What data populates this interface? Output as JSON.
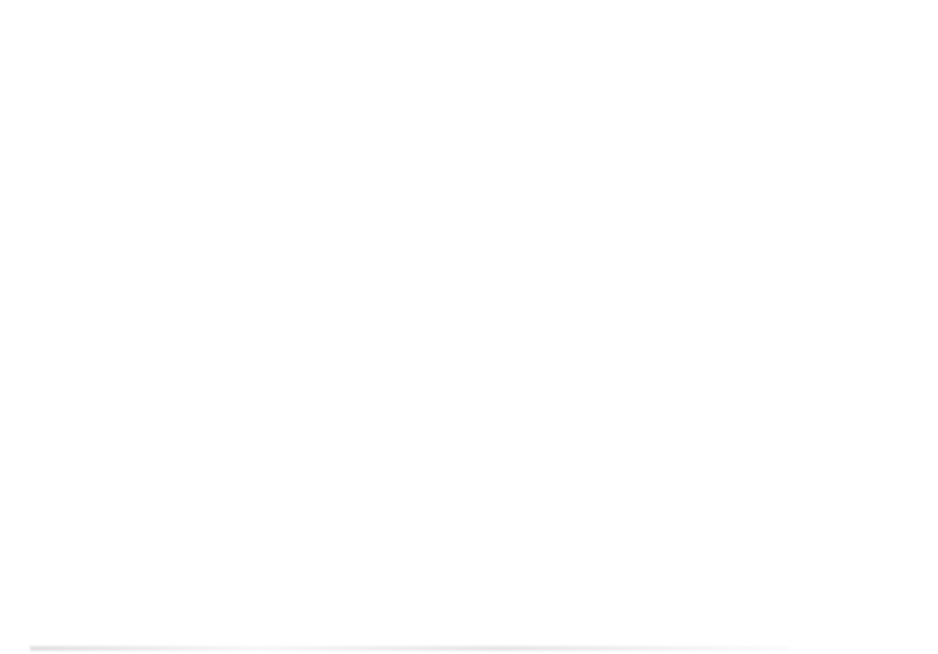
{
  "figure": {
    "caption": "FIG. 9.3",
    "panel_letters": [
      "(A)",
      "(B)",
      "(C)",
      "(D)"
    ]
  },
  "chart_data": [
    {
      "id": "panel-a",
      "letter": "(A)",
      "type": "line",
      "title": "",
      "xlabel": "On-switches in each I/Q path",
      "ylabel": "R_on (Ω)",
      "ylabel_parts": {
        "base": "R",
        "sub": "on",
        "unit": " (Ω)"
      },
      "xlim": [
        420,
        4300
      ],
      "ylim": [
        0,
        16
      ],
      "xticks": [
        1000,
        2000,
        3000,
        4000
      ],
      "xticklabels": [
        "1000",
        "2000",
        "3000",
        "4000"
      ],
      "yticks": [
        0,
        5,
        10,
        15
      ],
      "yticklabels": [
        "0",
        "5",
        "10",
        "15"
      ],
      "grid": true,
      "legend_position": "top-right",
      "x": [
        512,
        1024,
        1536,
        2048,
        2560,
        3072,
        3584,
        4096,
        4300
      ],
      "series": [
        {
          "name": "Single DRAC",
          "marker": "square",
          "color": "#4f4f4f",
          "values": [
            7.6,
            3.0,
            1.52,
            0.95,
            0.68,
            0.5,
            0.38,
            0.24,
            0.2
          ]
        },
        {
          "name": "Cascode DRAC",
          "marker": "diamond",
          "color": "#8c8c8c",
          "values": [
            15.2,
            6.7,
            3.9,
            2.6,
            1.75,
            1.3,
            1.0,
            0.74,
            0.68
          ]
        }
      ]
    },
    {
      "id": "panel-b",
      "letter": "(B)",
      "type": "line",
      "title": "",
      "xlabel": "On-switches in each I/Q path",
      "ylabel": "Drain efficiency (%)",
      "xlim": [
        420,
        4300
      ],
      "ylim": [
        20,
        102
      ],
      "xticks": [
        1000,
        2000,
        3000,
        4000
      ],
      "xticklabels": [
        "1000",
        "2000",
        "3000",
        "4000"
      ],
      "yticks": [
        20,
        40,
        60,
        80,
        100
      ],
      "yticklabels": [
        "20",
        "40",
        "60",
        "80",
        "100"
      ],
      "grid": true,
      "legend_position": "bottom-right",
      "x": [
        512,
        1024,
        1536,
        2048,
        2560,
        3072,
        3584,
        4096,
        4300
      ],
      "series": [
        {
          "name": "Single DRAC",
          "marker": "square",
          "color": "#4f4f4f",
          "values": [
            50.0,
            76.3,
            85.5,
            90.2,
            93.2,
            94.8,
            96.2,
            96.8,
            97.0
          ]
        },
        {
          "name": "Cascode DRAC",
          "marker": "diamond",
          "color": "#8c8c8c",
          "values": [
            22.2,
            45.6,
            62.9,
            71.8,
            76.5,
            79.4,
            80.9,
            81.6,
            81.8
          ]
        }
      ]
    },
    {
      "id": "panel-c",
      "letter": "(C)",
      "type": "line",
      "title": "",
      "xlabel": "On-switches in each I/Q path",
      "ylabel": "Capacitance (pF)",
      "xlim": [
        420,
        4300
      ],
      "ylim": [
        0,
        2.5
      ],
      "xticks": [
        1000,
        2000,
        3000,
        4000
      ],
      "xticklabels": [
        "1000",
        "2000",
        "3000",
        "4000"
      ],
      "yticks": [
        0,
        0.5,
        1,
        1.5,
        2,
        2.5
      ],
      "yticklabels": [
        "0",
        "0.5",
        "1",
        "1.5",
        "2",
        "2.5"
      ],
      "grid": true,
      "legend_position": "top-left",
      "x": [
        512,
        1024,
        1536,
        2048,
        2560,
        3072,
        3584,
        4096
      ],
      "series": [
        {
          "name": "C_gate",
          "label_parts": {
            "base": "C",
            "sub": "gate"
          },
          "marker": "square",
          "color": "#4f4f4f",
          "values": [
            0.28,
            0.56,
            0.83,
            1.11,
            1.39,
            1.65,
            1.93,
            2.2
          ]
        },
        {
          "name": "C_drain",
          "label_parts": {
            "base": "C",
            "sub": "drain"
          },
          "marker": "diamond",
          "color": "#8c8c8c",
          "values": [
            0.15,
            0.29,
            0.44,
            0.58,
            0.73,
            0.87,
            1.02,
            1.16
          ]
        }
      ]
    },
    {
      "id": "panel-d",
      "letter": "(D)",
      "type": "line",
      "title": "",
      "xlabel": "Drain voltage (V)",
      "ylabel": "Capacitance (pF)",
      "xlim": [
        0.085,
        1.25
      ],
      "ylim": [
        1,
        2.5
      ],
      "xticks": [
        0.2,
        0.4,
        0.6,
        0.8,
        1,
        1.2
      ],
      "xticklabels": [
        "0.2",
        "0.4",
        "0.6",
        "0.8",
        "1",
        "1.2"
      ],
      "yticks": [
        1,
        1.5,
        2,
        2.5
      ],
      "yticklabels": [
        "1",
        "1.5",
        "2",
        "2.5"
      ],
      "grid": true,
      "legend_position": "top-right",
      "x": [
        0.1,
        0.2,
        0.3,
        0.4,
        0.5,
        0.6,
        0.7,
        0.8,
        0.9,
        1.0,
        1.1,
        1.2
      ],
      "series": [
        {
          "name": "C_drain, on-switch 4096",
          "label_parts": {
            "base": "C",
            "sub": "drain",
            "rest": ", on-switch 4096"
          },
          "marker": "square",
          "color": "#4f4f4f",
          "values": [
            2.29,
            2.14,
            1.89,
            1.55,
            1.35,
            1.27,
            1.23,
            1.2,
            1.18,
            1.165,
            1.15,
            1.14
          ]
        }
      ]
    }
  ]
}
